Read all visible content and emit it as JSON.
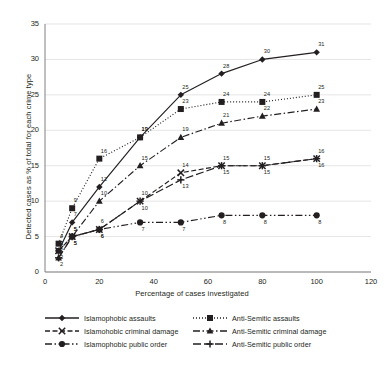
{
  "chart_data": {
    "type": "line",
    "title": "",
    "xlabel": "Percentage of cases investigated",
    "ylabel": "Detected cases as % of total for each crime type",
    "xlim": [
      0,
      120
    ],
    "ylim": [
      0,
      35
    ],
    "xticks": [
      "0",
      "20",
      "40",
      "60",
      "80",
      "100",
      "120"
    ],
    "yticks": [
      "0",
      "5",
      "10",
      "15",
      "20",
      "25",
      "30",
      "35"
    ],
    "grid": "horizontal",
    "legend_position": "bottom",
    "x": [
      5,
      10,
      20,
      35,
      50,
      65,
      80,
      100
    ],
    "series": [
      {
        "name": "Islamophobic assaults",
        "marker": "diamond",
        "dash": "solid",
        "values": [
          3,
          7,
          12,
          19,
          25,
          28,
          30,
          31
        ],
        "labels": [
          "3",
          "7",
          "12",
          "19",
          "25",
          "28",
          "30",
          "31"
        ]
      },
      {
        "name": "Anti-Semitic assaults",
        "marker": "square",
        "dash": "dotted",
        "values": [
          4,
          9,
          16,
          19,
          23,
          24,
          24,
          25
        ],
        "labels": [
          "4",
          "9",
          "16",
          "19",
          "23",
          "24",
          "24",
          "25"
        ]
      },
      {
        "name": "Anti-Semitic criminal damage",
        "marker": "triangle",
        "dash": "dashdot",
        "values": [
          2,
          5,
          10,
          15,
          19,
          21,
          22,
          23
        ],
        "labels": [
          "2",
          "5",
          "10",
          "15",
          "19",
          "21",
          "22",
          "23"
        ]
      },
      {
        "name": "Islamohobic criminal damage",
        "marker": "cross",
        "dash": "dashed",
        "values": [
          3,
          5,
          6,
          10,
          14,
          15,
          15,
          16
        ],
        "labels": [
          "3",
          "5",
          "6",
          "10",
          "14",
          "15",
          "15",
          "16"
        ]
      },
      {
        "name": "Anti-Semitic public order",
        "marker": "plus",
        "dash": "longdash",
        "values": [
          2,
          5,
          6,
          10,
          13,
          15,
          15,
          16
        ],
        "labels": [
          "2",
          "5",
          "6",
          "10",
          "13",
          "15",
          "15",
          "16"
        ]
      },
      {
        "name": "Islamophobic public order",
        "marker": "circle",
        "dash": "dashdotdot",
        "values": [
          3,
          5,
          6,
          7,
          7,
          8,
          8,
          8
        ],
        "labels": [
          "3",
          "5",
          "6",
          "7",
          "7",
          "8",
          "8",
          "8"
        ]
      }
    ]
  },
  "legend": {
    "rows": [
      {
        "left": "Islamophobic assaults",
        "right": "Anti-Semitic assaults"
      },
      {
        "left": "Islamohobic criminal damage",
        "right": "Anti-Semitic criminal damage"
      },
      {
        "left": "Islamophobic public order",
        "right": "Anti-Semitic public order"
      }
    ]
  },
  "colors": {
    "ink": "#231f20",
    "grid": "#d9d9d9",
    "axis": "#808080",
    "background": "#ffffff"
  }
}
